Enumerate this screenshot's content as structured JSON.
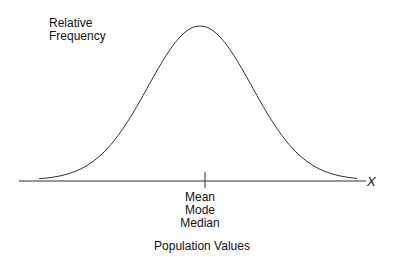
{
  "chart_data": {
    "type": "line",
    "title": "",
    "xlabel": "Population Values",
    "ylabel": "Relative Frequency",
    "x_axis_symbol": "X",
    "center_labels": [
      "Mean",
      "Mode",
      "Median"
    ],
    "grid": false,
    "series": [
      {
        "name": "normal curve",
        "x": [
          -3,
          -2,
          -1,
          0,
          1,
          2,
          3
        ],
        "y": [
          0.011,
          0.135,
          0.607,
          1.0,
          0.607,
          0.135,
          0.011
        ]
      }
    ]
  },
  "labels": {
    "ylabel_line1": "Relative",
    "ylabel_line2": "Frequency",
    "x_symbol": "X",
    "center1": "Mean",
    "center2": "Mode",
    "center3": "Median",
    "xlabel": "Population Values"
  }
}
